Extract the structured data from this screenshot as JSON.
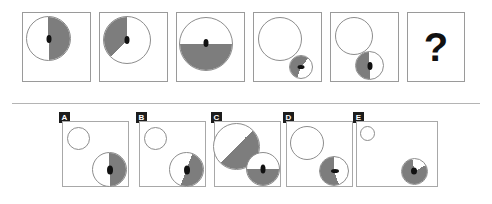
{
  "puzzle": {
    "type": "visual-analogy-matrix",
    "question_mark": "?",
    "colors": {
      "shade": "#7d7d7d",
      "outline": "#8d8d8d",
      "panel_border": "#9a9a9a",
      "pip": "#111111",
      "badge_bg": "#1c1c1c",
      "badge_text": "#ffffff",
      "background": "#ffffff",
      "divider": "#b4b4b4"
    }
  },
  "sequence": {
    "name": "top-sequence-row",
    "panels": [
      {
        "id": "panel-1",
        "label": "1",
        "shapes": [
          {
            "name": "circle-large",
            "shade": "right-half",
            "pip": "black-ellipse"
          }
        ]
      },
      {
        "id": "panel-2",
        "label": "2",
        "shapes": [
          {
            "name": "circle-large",
            "shade": "upper-left-wedge",
            "pip": "black-ellipse"
          }
        ]
      },
      {
        "id": "panel-3",
        "label": "3",
        "shapes": [
          {
            "name": "circle-large",
            "shade": "bottom-half",
            "pip": "black-ellipse"
          }
        ]
      },
      {
        "id": "panel-4",
        "label": "4",
        "shapes": [
          {
            "name": "circle-large",
            "shade": "none",
            "pip": "none"
          },
          {
            "name": "circle-small",
            "shade": "upper-portion",
            "pip": "black-ellipse"
          }
        ]
      },
      {
        "id": "panel-5",
        "label": "5",
        "shapes": [
          {
            "name": "circle-large",
            "shade": "none",
            "pip": "none"
          },
          {
            "name": "circle-small",
            "shade": "left-half",
            "pip": "black-ellipse"
          }
        ]
      },
      {
        "id": "panel-6",
        "label": "6",
        "shapes": [],
        "content": "?"
      }
    ]
  },
  "options": {
    "name": "answer-options-row",
    "items": [
      {
        "letter": "A",
        "shapes": [
          {
            "name": "circle-small-top",
            "shade": "none",
            "pip": "none"
          },
          {
            "name": "circle-large-bottom",
            "shade": "right-half",
            "pip": "black-ellipse"
          }
        ]
      },
      {
        "letter": "B",
        "shapes": [
          {
            "name": "circle-small-top",
            "shade": "none",
            "pip": "none"
          },
          {
            "name": "circle-large-bottom",
            "shade": "right-half-lower-wedge",
            "pip": "black-ellipse"
          }
        ]
      },
      {
        "letter": "C",
        "shapes": [
          {
            "name": "circle-large-top",
            "shade": "upper-right-diagonal",
            "pip": "none"
          },
          {
            "name": "circle-medium-bottom",
            "shade": "bottom-half",
            "pip": "black-ellipse"
          }
        ]
      },
      {
        "letter": "D",
        "shapes": [
          {
            "name": "circle-large-top",
            "shade": "none",
            "pip": "none"
          },
          {
            "name": "circle-medium-bottom",
            "shade": "left-portion",
            "pip": "black-ellipse"
          }
        ]
      },
      {
        "letter": "E",
        "shapes": [
          {
            "name": "circle-tiny-top",
            "shade": "none",
            "pip": "none"
          },
          {
            "name": "circle-small-bottom",
            "shade": "most",
            "pip": "black-ellipse"
          }
        ]
      }
    ]
  }
}
